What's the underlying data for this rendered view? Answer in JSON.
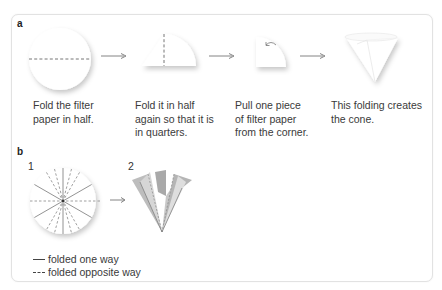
{
  "section_a": {
    "label": "a",
    "steps": [
      {
        "caption_lines": [
          "Fold the filter",
          "paper in half."
        ],
        "illustration": "circle-folded-in-half-icon"
      },
      {
        "caption_lines": [
          "Fold it in half",
          "again so that it is",
          "in quarters."
        ],
        "illustration": "quarter-circle-icon"
      },
      {
        "caption_lines": [
          "Pull one piece",
          "of filter paper",
          "from the corner."
        ],
        "illustration": "quarter-pull-corner-icon"
      },
      {
        "caption_lines": [
          "This folding creates",
          "the cone."
        ],
        "illustration": "cone-icon"
      }
    ],
    "arrow": "right-arrow-icon"
  },
  "section_b": {
    "label": "b",
    "figure1_number": "1",
    "figure2_number": "2",
    "legend": {
      "solid": "folded one way",
      "dashed": "folded opposite way"
    }
  },
  "colors": {
    "border": "#e2e2e2",
    "text": "#3a3a3a",
    "line": "#777777",
    "shadow": "#cfcfcf",
    "fold_gray": "#a8a8a8"
  }
}
